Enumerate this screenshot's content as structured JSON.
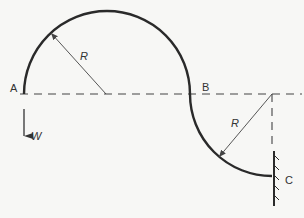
{
  "figure": {
    "type": "curved beam / hook diagram",
    "labels": {
      "point_a": "A",
      "point_b": "B",
      "point_c": "C",
      "radius_upper": "R",
      "radius_lower": "R",
      "load": "W"
    },
    "colors": {
      "beam": "#2a2a2a",
      "construction": "#444444",
      "background": "#f7f7f5"
    }
  }
}
